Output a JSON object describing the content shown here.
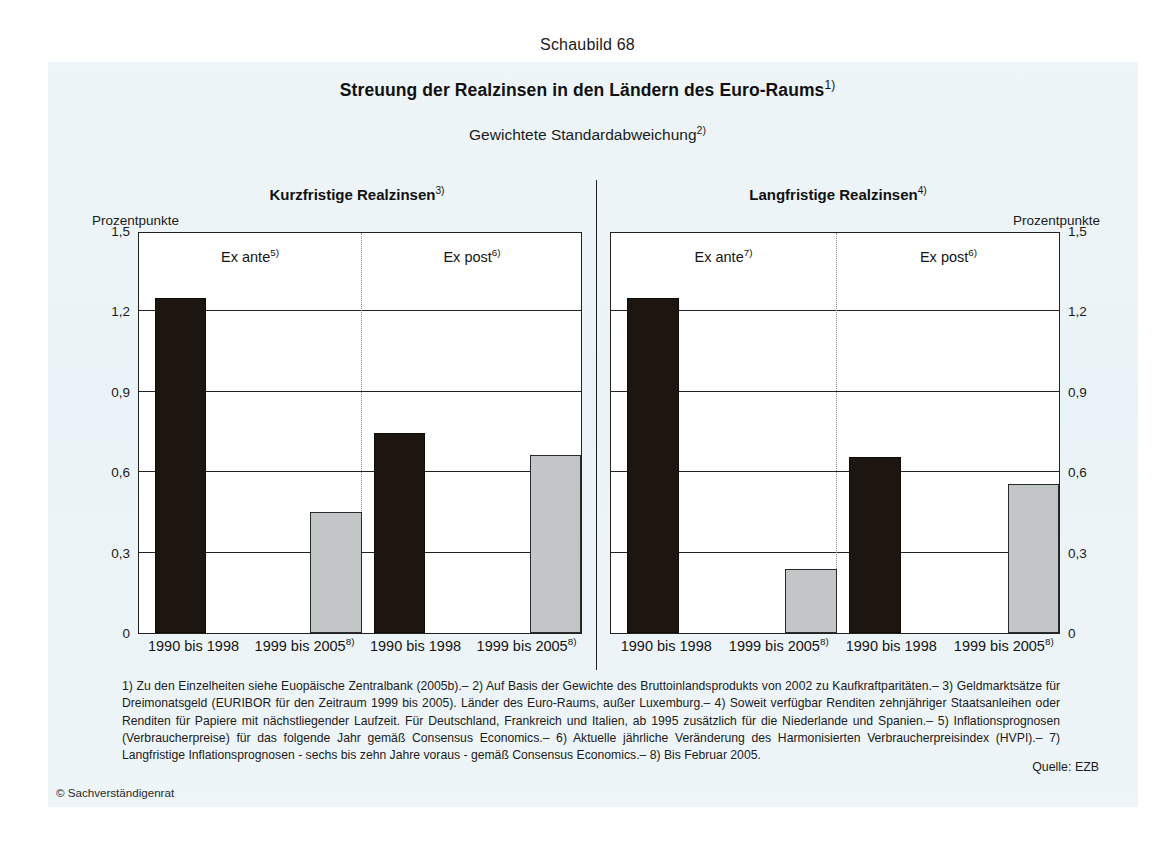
{
  "header": {
    "figure_number": "Schaubild 68",
    "title": "Streuung der Realzinsen in den Ländern des Euro-Raums",
    "title_footnote": "1)",
    "subtitle": "Gewichtete Standardabweichung",
    "subtitle_footnote": "2)"
  },
  "panels": {
    "left": {
      "title": "Kurzfristige Realzinsen",
      "title_footnote": "3)",
      "unit": "Prozentpunkte",
      "groups": [
        {
          "label": "Ex ante",
          "footnote": "5)"
        },
        {
          "label": "Ex post",
          "footnote": "6)"
        }
      ]
    },
    "right": {
      "title": "Langfristige Realzinsen",
      "title_footnote": "4)",
      "unit": "Prozentpunkte",
      "groups": [
        {
          "label": "Ex ante",
          "footnote": "7)"
        },
        {
          "label": "Ex post",
          "footnote": "6)"
        }
      ]
    }
  },
  "footnotes": "1) Zu den Einzelheiten siehe Euopäische Zentralbank (2005b).– 2) Auf Basis der Gewichte des Bruttoinlandsprodukts von 2002 zu Kaufkraftparitäten.– 3) Geldmarktsätze für Dreimonatsgeld (EURIBOR für den Zeitraum 1999 bis 2005). Länder des Euro-Raums, außer Luxemburg.– 4) Soweit verfügbar Renditen zehnjähriger Staatsanleihen oder Renditen für Papiere mit nächstliegender Laufzeit. Für Deutschland, Frankreich und Italien, ab 1995 zusätzlich für die Niederlande und Spanien.– 5) Inflationsprognosen (Verbraucherpreise) für das folgende Jahr gemäß Consensus Economics.– 6) Aktuelle jährliche Veränderung des Harmonisierten Verbraucherpreisindex (HVPI).– 7) Langfristige Inflationsprognosen - sechs bis zehn Jahre voraus - gemäß Consensus Economics.– 8) Bis Februar 2005.",
  "source": "Quelle: EZB",
  "copyright": "© Sachverständigenrat",
  "colors": {
    "bar_dark": "#1d1510",
    "bar_light": "#c2c6c6",
    "axis": "#222222",
    "page_tint": "#eef5f8"
  },
  "chart_data": [
    {
      "type": "bar",
      "title": "Kurzfristige Realzinsen",
      "subtitle": "Gewichtete Standardabweichung",
      "xlabel": "",
      "ylabel": "Prozentpunkte",
      "ylim": [
        0,
        1.5
      ],
      "yticks": [
        0,
        0.3,
        0.6,
        0.9,
        1.2,
        1.5
      ],
      "ytick_labels": [
        "0",
        "0,3",
        "0,6",
        "0,9",
        "1,2",
        "1,5"
      ],
      "grid": true,
      "legend": "none",
      "groups": [
        "Ex ante",
        "Ex post"
      ],
      "categories": [
        "1990 bis 1998",
        "1999 bis 2005",
        "1990 bis 1998",
        "1999 bis 2005"
      ],
      "category_footnotes": [
        "",
        "8)",
        "",
        "8)"
      ],
      "values": [
        1.25,
        0.45,
        0.745,
        0.665
      ],
      "bar_styles": [
        "dark",
        "light",
        "dark",
        "light"
      ]
    },
    {
      "type": "bar",
      "title": "Langfristige Realzinsen",
      "subtitle": "Gewichtete Standardabweichung",
      "xlabel": "",
      "ylabel": "Prozentpunkte",
      "ylim": [
        0,
        1.5
      ],
      "yticks": [
        0,
        0.3,
        0.6,
        0.9,
        1.2,
        1.5
      ],
      "ytick_labels": [
        "0",
        "0,3",
        "0,6",
        "0,9",
        "1,2",
        "1,5"
      ],
      "grid": true,
      "legend": "none",
      "groups": [
        "Ex ante",
        "Ex post"
      ],
      "categories": [
        "1990 bis 1998",
        "1999 bis 2005",
        "1990 bis 1998",
        "1999 bis 2005"
      ],
      "category_footnotes": [
        "",
        "8)",
        "",
        "8)"
      ],
      "values": [
        1.25,
        0.24,
        0.655,
        0.555
      ],
      "bar_styles": [
        "dark",
        "light",
        "dark",
        "light"
      ]
    }
  ]
}
